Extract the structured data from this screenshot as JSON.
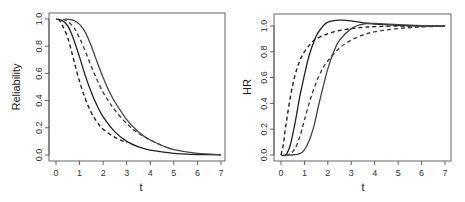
{
  "chart_data": [
    {
      "type": "line",
      "title": "",
      "xlabel": "t",
      "ylabel": "Reliability",
      "xlim": [
        0,
        7
      ],
      "ylim": [
        0,
        1.0
      ],
      "xticks": [
        "0",
        "1",
        "2",
        "3",
        "4",
        "5",
        "6",
        "7"
      ],
      "yticks": [
        "0.0",
        "0.2",
        "0.4",
        "0.6",
        "0.8",
        "1.0"
      ],
      "grid": false,
      "legend": null,
      "series": [
        {
          "name": "solid-1",
          "style": "solid",
          "color": "#222222",
          "x": [
            0,
            0.25,
            0.5,
            0.75,
            1.0,
            1.25,
            1.5,
            1.75,
            2.0,
            2.5,
            3.0,
            3.5,
            4.0,
            5.0,
            6.0,
            7.0
          ],
          "y": [
            1.0,
            0.99,
            0.95,
            0.85,
            0.72,
            0.58,
            0.46,
            0.36,
            0.28,
            0.17,
            0.1,
            0.06,
            0.035,
            0.012,
            0.004,
            0.001
          ]
        },
        {
          "name": "dashed-1",
          "style": "dashed",
          "color": "#222222",
          "x": [
            0.1,
            0.25,
            0.5,
            0.75,
            1.0,
            1.25,
            1.5,
            1.75,
            2.0,
            2.5,
            3.0
          ],
          "y": [
            1.0,
            0.96,
            0.86,
            0.7,
            0.54,
            0.41,
            0.31,
            0.24,
            0.19,
            0.13,
            0.09
          ]
        },
        {
          "name": "solid-2",
          "style": "solid",
          "color": "#444444",
          "x": [
            0.4,
            0.75,
            1.0,
            1.25,
            1.5,
            1.75,
            2.0,
            2.25,
            2.5,
            3.0,
            3.5,
            4.0,
            4.5,
            5.0,
            6.0,
            7.0
          ],
          "y": [
            1.0,
            0.99,
            0.96,
            0.9,
            0.8,
            0.68,
            0.57,
            0.47,
            0.39,
            0.26,
            0.17,
            0.11,
            0.07,
            0.04,
            0.012,
            0.002
          ]
        },
        {
          "name": "dashed-2",
          "style": "dashed",
          "color": "#444444",
          "x": [
            0.3,
            0.5,
            0.75,
            1.0,
            1.25,
            1.5,
            1.75,
            2.0,
            2.25,
            2.5,
            3.0,
            3.5,
            4.0,
            4.5
          ],
          "y": [
            1.0,
            0.98,
            0.94,
            0.86,
            0.76,
            0.65,
            0.55,
            0.46,
            0.39,
            0.33,
            0.23,
            0.16,
            0.11,
            0.07
          ]
        }
      ]
    },
    {
      "type": "line",
      "title": "",
      "xlabel": "t",
      "ylabel": "HR",
      "xlim": [
        0,
        7
      ],
      "ylim": [
        0,
        1.0
      ],
      "xticks": [
        "0",
        "1",
        "2",
        "3",
        "4",
        "5",
        "6",
        "7"
      ],
      "yticks": [
        "0.0",
        "0.2",
        "0.4",
        "0.6",
        "0.8",
        "1.0"
      ],
      "grid": false,
      "legend": null,
      "series": [
        {
          "name": "solid-1",
          "style": "solid",
          "color": "#222222",
          "x": [
            0.0,
            0.2,
            0.4,
            0.6,
            0.8,
            1.0,
            1.2,
            1.5,
            1.75,
            2.0,
            2.5,
            3.0,
            3.5,
            4.0,
            5.0,
            6.0,
            7.0
          ],
          "y": [
            0.0,
            0.0,
            0.08,
            0.25,
            0.45,
            0.62,
            0.77,
            0.92,
            0.99,
            1.03,
            1.045,
            1.04,
            1.025,
            1.015,
            1.005,
            1.0,
            1.0
          ]
        },
        {
          "name": "dashed-1",
          "style": "dashed",
          "color": "#222222",
          "x": [
            0.0,
            0.1,
            0.2,
            0.4,
            0.6,
            0.8,
            1.0,
            1.25,
            1.5,
            2.0,
            2.5,
            3.0,
            3.5,
            4.0,
            5.0,
            6.0,
            7.0
          ],
          "y": [
            0.0,
            0.08,
            0.22,
            0.45,
            0.62,
            0.73,
            0.8,
            0.86,
            0.9,
            0.94,
            0.965,
            0.98,
            0.99,
            0.995,
            1.0,
            1.0,
            1.0
          ]
        },
        {
          "name": "solid-2",
          "style": "solid",
          "color": "#444444",
          "x": [
            0.1,
            0.5,
            0.8,
            1.0,
            1.2,
            1.4,
            1.6,
            1.8,
            2.0,
            2.25,
            2.5,
            3.0,
            3.5,
            4.0,
            5.0,
            6.0,
            7.0
          ],
          "y": [
            0.0,
            0.0,
            0.01,
            0.04,
            0.11,
            0.22,
            0.38,
            0.53,
            0.67,
            0.8,
            0.89,
            0.98,
            1.015,
            1.02,
            1.01,
            1.003,
            1.0
          ]
        },
        {
          "name": "dashed-2",
          "style": "dashed",
          "color": "#444444",
          "x": [
            0.2,
            0.4,
            0.6,
            0.8,
            1.0,
            1.25,
            1.5,
            1.75,
            2.0,
            2.5,
            3.0,
            3.5,
            4.0,
            5.0,
            6.0,
            7.0
          ],
          "y": [
            0.0,
            0.01,
            0.05,
            0.14,
            0.27,
            0.43,
            0.56,
            0.66,
            0.73,
            0.83,
            0.89,
            0.93,
            0.955,
            0.98,
            0.993,
            1.0
          ]
        }
      ]
    }
  ]
}
